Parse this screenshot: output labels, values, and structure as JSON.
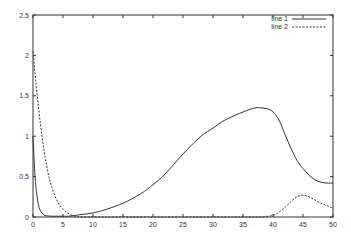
{
  "chart_data": {
    "type": "line",
    "title": "",
    "xlabel": "",
    "ylabel": "",
    "xlim": [
      0,
      50
    ],
    "ylim": [
      0,
      2.5
    ],
    "grid": false,
    "legend_position": "upper right",
    "xticks": [
      0,
      5,
      10,
      15,
      20,
      25,
      30,
      35,
      40,
      45,
      50
    ],
    "yticks": [
      0,
      0.5,
      1,
      1.5,
      2,
      2.5
    ],
    "xtick_labels": [
      "0",
      "5",
      "10",
      "15",
      "20",
      "25",
      "30",
      "35",
      "40",
      "45",
      "50"
    ],
    "ytick_labels": [
      "0",
      "0.5",
      "1",
      "1.5",
      "2",
      "2.5"
    ],
    "series": [
      {
        "name": "line 1",
        "style": "solid",
        "color": "#333333",
        "x": [
          0,
          0.3,
          0.6,
          1,
          1.5,
          2,
          3,
          4,
          5,
          6,
          8,
          10,
          12,
          15,
          18,
          20,
          22,
          25,
          28,
          30,
          32,
          35,
          37,
          38,
          39,
          40,
          41,
          42,
          43,
          44,
          45,
          46,
          47,
          48,
          49,
          50
        ],
        "y": [
          1.0,
          0.55,
          0.3,
          0.12,
          0.05,
          0.02,
          0.01,
          0.01,
          0.01,
          0.01,
          0.03,
          0.05,
          0.09,
          0.17,
          0.29,
          0.4,
          0.53,
          0.78,
          1.0,
          1.1,
          1.2,
          1.3,
          1.35,
          1.35,
          1.34,
          1.3,
          1.2,
          1.02,
          0.85,
          0.7,
          0.6,
          0.52,
          0.46,
          0.43,
          0.42,
          0.42
        ]
      },
      {
        "name": "line 2",
        "style": "dashed",
        "color": "#333333",
        "x": [
          0,
          0.5,
          1,
          1.5,
          2,
          2.5,
          3,
          4,
          5,
          6,
          7,
          8,
          10,
          20,
          30,
          36,
          38,
          40,
          41,
          42,
          43,
          44,
          45,
          46,
          47,
          48,
          49,
          50
        ],
        "y": [
          2.05,
          1.65,
          1.3,
          1.0,
          0.75,
          0.55,
          0.4,
          0.2,
          0.1,
          0.04,
          0.01,
          0.0,
          0.0,
          0.0,
          0.0,
          0.0,
          0.0,
          0.02,
          0.06,
          0.12,
          0.19,
          0.25,
          0.27,
          0.25,
          0.21,
          0.17,
          0.14,
          0.11
        ]
      }
    ]
  },
  "legend": {
    "items": [
      {
        "label": "line 1",
        "style": "solid"
      },
      {
        "label": "line 2",
        "style": "dashed"
      }
    ]
  },
  "colors": {
    "axis": "#333333",
    "text": "#333333",
    "background": "#ffffff"
  }
}
